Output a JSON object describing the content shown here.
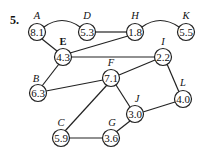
{
  "problem": {
    "number": "5."
  },
  "nodes": {
    "A": {
      "letter": "A",
      "value": "8.1"
    },
    "D": {
      "letter": "D",
      "value": "5.3"
    },
    "H": {
      "letter": "H",
      "value": "1.8"
    },
    "K": {
      "letter": "K",
      "value": "5.5"
    },
    "E": {
      "letter": "E",
      "value": "4.3"
    },
    "I": {
      "letter": "I",
      "value": "2.2"
    },
    "F": {
      "letter": "F",
      "value": "7.1"
    },
    "B": {
      "letter": "B",
      "value": "6.3"
    },
    "L": {
      "letter": "L",
      "value": "4.0"
    },
    "J": {
      "letter": "J",
      "value": "3.0"
    },
    "C": {
      "letter": "C",
      "value": "5.9"
    },
    "G": {
      "letter": "G",
      "value": "3.6"
    }
  },
  "edges": [
    [
      "A",
      "D"
    ],
    [
      "A",
      "E"
    ],
    [
      "D",
      "H"
    ],
    [
      "H",
      "K"
    ],
    [
      "H",
      "E"
    ],
    [
      "E",
      "I"
    ],
    [
      "E",
      "B"
    ],
    [
      "B",
      "F"
    ],
    [
      "F",
      "I"
    ],
    [
      "F",
      "C"
    ],
    [
      "F",
      "J"
    ],
    [
      "I",
      "L"
    ],
    [
      "L",
      "J"
    ],
    [
      "J",
      "G"
    ],
    [
      "C",
      "G"
    ]
  ]
}
